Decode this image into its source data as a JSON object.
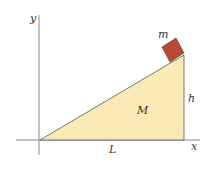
{
  "diagram": {
    "labels": {
      "y_axis": "y",
      "x_axis": "x",
      "block_mass": "m",
      "wedge_mass": "M",
      "height": "h",
      "length": "L"
    },
    "colors": {
      "wedge_fill": "#faeab5",
      "block_fill": "#b84a34",
      "axis": "#888888",
      "edge": "#555555"
    }
  }
}
